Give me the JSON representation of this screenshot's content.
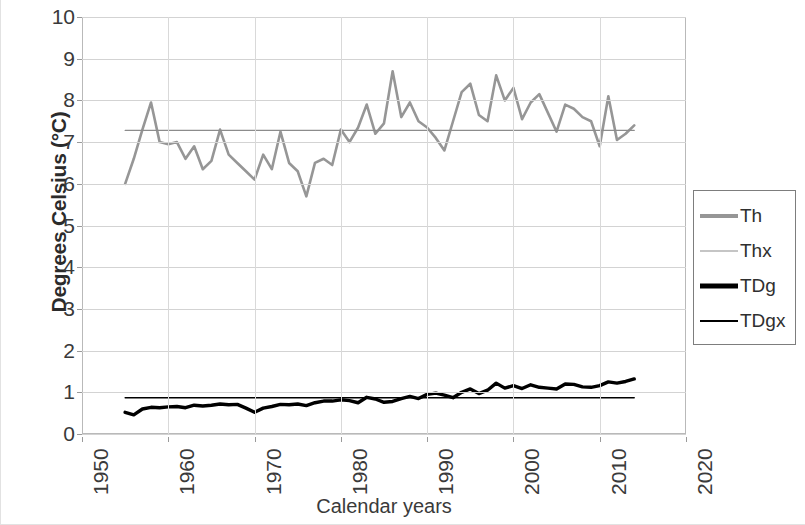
{
  "chart_data": {
    "type": "line",
    "title": "",
    "xlabel": "Calendar years",
    "ylabel": "Degrees Celsius (°C)",
    "xlim": [
      1950,
      2020
    ],
    "ylim": [
      0,
      10
    ],
    "xticks": [
      "1950",
      "1960",
      "1970",
      "1980",
      "1990",
      "2000",
      "2010",
      "2020"
    ],
    "yticks": [
      "0",
      "1",
      "2",
      "3",
      "4",
      "5",
      "6",
      "7",
      "8",
      "9",
      "10"
    ],
    "grid": "horizontal-and-vertical",
    "legend_position": "right-outside",
    "series": [
      {
        "name": "Th",
        "style": "thick-gray-line",
        "color": "#969696",
        "x": [
          1955,
          1956,
          1957,
          1958,
          1959,
          1960,
          1961,
          1962,
          1963,
          1964,
          1965,
          1966,
          1967,
          1968,
          1969,
          1970,
          1971,
          1972,
          1973,
          1974,
          1975,
          1976,
          1977,
          1978,
          1979,
          1980,
          1981,
          1982,
          1983,
          1984,
          1985,
          1986,
          1987,
          1988,
          1989,
          1990,
          1991,
          1992,
          1993,
          1994,
          1995,
          1996,
          1997,
          1998,
          1999,
          2000,
          2001,
          2002,
          2003,
          2004,
          2005,
          2006,
          2007,
          2008,
          2009,
          2010,
          2011,
          2012,
          2013,
          2014
        ],
        "values": [
          6.0,
          6.6,
          7.3,
          7.95,
          7.0,
          6.95,
          7.0,
          6.6,
          6.9,
          6.35,
          6.55,
          7.3,
          6.7,
          6.5,
          6.3,
          6.1,
          6.7,
          6.35,
          7.25,
          6.5,
          6.3,
          5.7,
          6.5,
          6.6,
          6.45,
          7.3,
          7.0,
          7.35,
          7.9,
          7.2,
          7.45,
          8.7,
          7.6,
          7.95,
          7.5,
          7.35,
          7.1,
          6.8,
          7.5,
          8.2,
          8.4,
          7.65,
          7.5,
          8.6,
          8.0,
          8.3,
          7.55,
          7.95,
          8.15,
          7.7,
          7.25,
          7.9,
          7.8,
          7.6,
          7.5,
          6.9,
          8.1,
          7.05,
          7.2,
          7.4
        ]
      },
      {
        "name": "Thx",
        "style": "thin-gray-line",
        "color": "#8c8c8c",
        "description": "horizontal reference line",
        "x": [
          1955,
          2014
        ],
        "values": [
          7.28,
          7.28
        ]
      },
      {
        "name": "TDg",
        "style": "thick-black-line",
        "color": "#000000",
        "x": [
          1955,
          1956,
          1957,
          1958,
          1959,
          1960,
          1961,
          1962,
          1963,
          1964,
          1965,
          1966,
          1967,
          1968,
          1969,
          1970,
          1971,
          1972,
          1973,
          1974,
          1975,
          1976,
          1977,
          1978,
          1979,
          1980,
          1981,
          1982,
          1983,
          1984,
          1985,
          1986,
          1987,
          1988,
          1989,
          1990,
          1991,
          1992,
          1993,
          1994,
          1995,
          1996,
          1997,
          1998,
          1999,
          2000,
          2001,
          2002,
          2003,
          2004,
          2005,
          2006,
          2007,
          2008,
          2009,
          2010,
          2011,
          2012,
          2013,
          2014
        ],
        "values": [
          0.52,
          0.46,
          0.6,
          0.64,
          0.63,
          0.65,
          0.66,
          0.63,
          0.69,
          0.67,
          0.69,
          0.72,
          0.7,
          0.71,
          0.62,
          0.52,
          0.62,
          0.66,
          0.71,
          0.7,
          0.72,
          0.68,
          0.75,
          0.79,
          0.79,
          0.82,
          0.8,
          0.75,
          0.88,
          0.84,
          0.76,
          0.78,
          0.85,
          0.9,
          0.85,
          0.95,
          0.98,
          0.93,
          0.87,
          1.0,
          1.08,
          0.97,
          1.05,
          1.22,
          1.1,
          1.16,
          1.09,
          1.18,
          1.12,
          1.1,
          1.08,
          1.2,
          1.19,
          1.13,
          1.12,
          1.16,
          1.25,
          1.22,
          1.26,
          1.32
        ]
      },
      {
        "name": "TDgx",
        "style": "thin-black-line",
        "color": "#000000",
        "description": "horizontal reference line",
        "x": [
          1955,
          2014
        ],
        "values": [
          0.87,
          0.87
        ]
      }
    ]
  },
  "legend": {
    "items": [
      {
        "label": "Th"
      },
      {
        "label": "Thx"
      },
      {
        "label": "TDg"
      },
      {
        "label": "TDgx"
      }
    ]
  }
}
